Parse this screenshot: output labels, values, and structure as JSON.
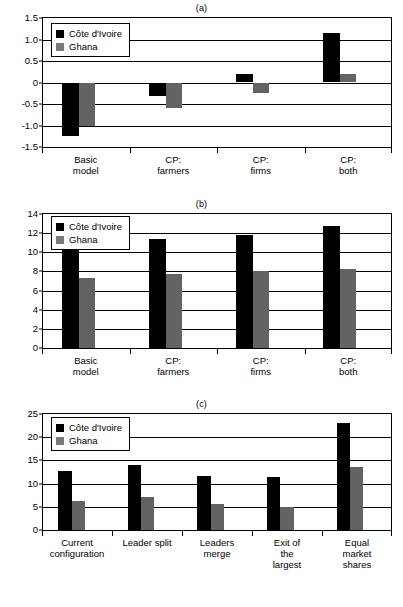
{
  "figure": {
    "series_names": [
      "Côte d'Ivoire",
      "Ghana"
    ],
    "colors": {
      "cote_divoire": "#000000",
      "ghana": "#636363",
      "axis": "#000000",
      "background": "#ffffff"
    }
  },
  "legend": {
    "ci_label": "Côte d'Ivoire",
    "gh_label": "Ghana"
  },
  "panels": {
    "a": {
      "title": "(a)",
      "yticks": [
        "1.5",
        "1.0",
        "0.5",
        "0",
        "-0.5",
        "-1.0",
        "-1.5"
      ],
      "categories": [
        "Basic\nmodel",
        "CP:\nfarmers",
        "CP:\nfirms",
        "CP:\nboth"
      ]
    },
    "b": {
      "title": "(b)",
      "yticks": [
        "14",
        "12",
        "10",
        "8",
        "6",
        "4",
        "2",
        "0"
      ],
      "categories": [
        "Basic\nmodel",
        "CP:\nfarmers",
        "CP:\nfirms",
        "CP:\nboth"
      ]
    },
    "c": {
      "title": "(c)",
      "yticks": [
        "25",
        "20",
        "15",
        "10",
        "5",
        "0"
      ],
      "categories": [
        "Current\nconfiguration",
        "Leader split",
        "Leaders\nmerge",
        "Exit of\nthe\nlargest",
        "Equal\nmarket\nshares"
      ]
    }
  },
  "chart_data": [
    {
      "id": "a",
      "type": "bar",
      "title": "(a)",
      "xlabel": "",
      "ylabel": "",
      "ylim": [
        -1.5,
        1.5
      ],
      "ytick_values": [
        1.5,
        1.0,
        0.5,
        0,
        -0.5,
        -1.0,
        -1.5
      ],
      "grid": true,
      "legend_position": "top-left",
      "categories": [
        "Basic model",
        "CP: farmers",
        "CP: firms",
        "CP: both"
      ],
      "series": [
        {
          "name": "Côte d'Ivoire",
          "color": "#000000",
          "values": [
            -1.25,
            -0.32,
            0.2,
            1.15
          ]
        },
        {
          "name": "Ghana",
          "color": "#636363",
          "values": [
            -1.0,
            -0.6,
            -0.25,
            0.19
          ]
        }
      ]
    },
    {
      "id": "b",
      "type": "bar",
      "title": "(b)",
      "xlabel": "",
      "ylabel": "",
      "ylim": [
        0,
        14
      ],
      "ytick_values": [
        14,
        12,
        10,
        8,
        6,
        4,
        2,
        0
      ],
      "grid": true,
      "legend_position": "top-left",
      "categories": [
        "Basic model",
        "CP: farmers",
        "CP: firms",
        "CP: both"
      ],
      "series": [
        {
          "name": "Côte d'Ivoire",
          "color": "#000000",
          "values": [
            10.5,
            11.4,
            11.8,
            12.7
          ]
        },
        {
          "name": "Ghana",
          "color": "#636363",
          "values": [
            7.3,
            7.7,
            8.0,
            8.3
          ]
        }
      ]
    },
    {
      "id": "c",
      "type": "bar",
      "title": "(c)",
      "xlabel": "",
      "ylabel": "",
      "ylim": [
        0,
        25
      ],
      "ytick_values": [
        25,
        20,
        15,
        10,
        5,
        0
      ],
      "grid": true,
      "legend_position": "top-left",
      "categories": [
        "Current configuration",
        "Leader split",
        "Leaders merge",
        "Exit of the largest",
        "Equal market shares"
      ],
      "series": [
        {
          "name": "Côte d'Ivoire",
          "color": "#000000",
          "values": [
            12.7,
            14.0,
            11.7,
            11.4,
            23.1
          ]
        },
        {
          "name": "Ghana",
          "color": "#636363",
          "values": [
            6.2,
            7.1,
            5.7,
            5.0,
            13.5
          ]
        }
      ]
    }
  ]
}
